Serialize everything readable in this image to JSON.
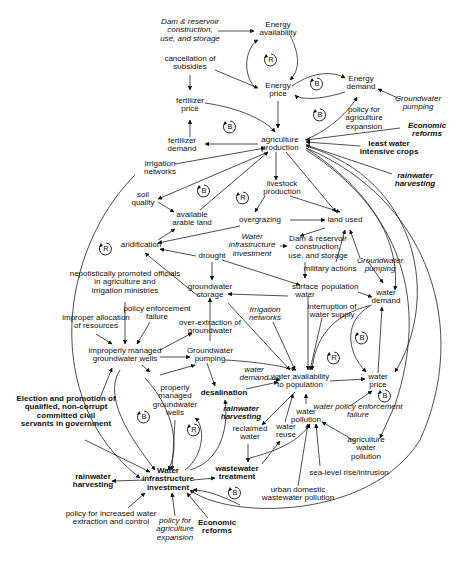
{
  "diagram": {
    "type": "causal-loop-diagram",
    "nodes": [
      {
        "id": "dam_top",
        "label": "Dam & reservoir\nconstruction,\nuse, and storage",
        "style": "italic",
        "x": 190,
        "y": 31
      },
      {
        "id": "energy_avail",
        "label": "Energy\navailability",
        "style": "normal",
        "x": 278,
        "y": 29
      },
      {
        "id": "cancel_subs",
        "label": "cancellation of\nsubsidies",
        "style": "normal",
        "x": 190,
        "y": 63
      },
      {
        "id": "energy_price",
        "label": "Energy\nprice",
        "style": "normal",
        "x": 278,
        "y": 90
      },
      {
        "id": "energy_demand",
        "label": "Energy\ndemand",
        "style": "normal",
        "x": 361,
        "y": 83
      },
      {
        "id": "gw_pumping_top",
        "label": "Groundwater\npumping",
        "style": "italic",
        "x": 418,
        "y": 103
      },
      {
        "id": "fert_price",
        "label": "fertilizer\nprice",
        "style": "normal",
        "x": 190,
        "y": 105
      },
      {
        "id": "policy_ag_exp_top",
        "label": "policy for\nagriculture\nexpansion",
        "style": "normal",
        "x": 364,
        "y": 119
      },
      {
        "id": "econ_reforms_top",
        "label": "Economic\nreforms",
        "style": "bold-italic",
        "x": 427,
        "y": 130
      },
      {
        "id": "fert_demand",
        "label": "fertilizer\ndemand",
        "style": "normal",
        "x": 182,
        "y": 145
      },
      {
        "id": "ag_production",
        "label": "agriculture\nproduction",
        "style": "normal",
        "x": 280,
        "y": 144
      },
      {
        "id": "least_water",
        "label": "least water\nintensive crops",
        "style": "bold",
        "x": 389,
        "y": 148
      },
      {
        "id": "irr_networks_top",
        "label": "irrigation\nnetworks",
        "style": "normal",
        "x": 160,
        "y": 168
      },
      {
        "id": "rain_harv_top",
        "label": "rainwater\nharvesting",
        "style": "bold-italic",
        "x": 415,
        "y": 180
      },
      {
        "id": "livestock",
        "label": "livestock\nproduction",
        "style": "normal",
        "x": 282,
        "y": 188
      },
      {
        "id": "soil_quality",
        "label": "soil\nquality",
        "style": "normal",
        "x": 143,
        "y": 199
      },
      {
        "id": "arable_land",
        "label": "available\narable land",
        "style": "normal",
        "x": 192,
        "y": 219
      },
      {
        "id": "overgrazing",
        "label": "overgrazing",
        "style": "normal",
        "x": 260,
        "y": 220
      },
      {
        "id": "land_used",
        "label": "land used",
        "style": "normal",
        "x": 345,
        "y": 220
      },
      {
        "id": "aridification",
        "label": "aridification",
        "style": "normal",
        "x": 141,
        "y": 245
      },
      {
        "id": "water_infra_mid",
        "label": "Water\ninfrastructure\ninvestment",
        "style": "italic",
        "x": 267,
        "y": 246
      },
      {
        "id": "dam_mid",
        "label": "Dam & reservoir\nconstruction,\nuse, and storage",
        "style": "normal",
        "x": 302,
        "y": 248
      },
      {
        "id": "drought",
        "label": "drought",
        "style": "normal",
        "x": 212,
        "y": 256
      },
      {
        "id": "military",
        "label": "military actions",
        "style": "normal",
        "x": 342,
        "y": 269
      },
      {
        "id": "gw_pumping_mid",
        "label": "Groundwater\npumping",
        "style": "italic",
        "x": 363,
        "y": 267
      },
      {
        "id": "nepotism",
        "label": "nepotistically promoted officials\nin agriculture and\nirrigation ministries",
        "style": "normal",
        "x": 125,
        "y": 283
      },
      {
        "id": "gw_storage",
        "label": "groundwater\nstorage",
        "style": "normal",
        "x": 210,
        "y": 291
      },
      {
        "id": "surface_water",
        "label": "surface\nwater",
        "style": "normal",
        "x": 305,
        "y": 291
      },
      {
        "id": "population",
        "label": "population",
        "style": "normal",
        "x": 346,
        "y": 287
      },
      {
        "id": "water_demand_r",
        "label": "water\ndemand",
        "style": "normal",
        "x": 386,
        "y": 297
      },
      {
        "id": "policy_enf_left",
        "label": "policy enforcement\nfailure",
        "style": "normal",
        "x": 157,
        "y": 313
      },
      {
        "id": "improper_alloc",
        "label": "improper allocation\nof resources",
        "style": "normal",
        "x": 96,
        "y": 322
      },
      {
        "id": "overextraction",
        "label": "over-extraction of\ngroundwater",
        "style": "normal",
        "x": 210,
        "y": 327
      },
      {
        "id": "irr_networks_mid",
        "label": "Irrigation\nnetworks",
        "style": "italic",
        "x": 265,
        "y": 314
      },
      {
        "id": "interruption",
        "label": "interruption of\nwater supply",
        "style": "normal",
        "x": 332,
        "y": 311
      },
      {
        "id": "improper_wells",
        "label": "improperly managed\ngroundwater wells",
        "style": "normal",
        "x": 125,
        "y": 355
      },
      {
        "id": "gw_pumping_low",
        "label": "Groundwater\npumping",
        "style": "normal",
        "x": 210,
        "y": 355
      },
      {
        "id": "water_demand_l",
        "label": "water\ndemand",
        "style": "italic",
        "x": 254,
        "y": 374
      },
      {
        "id": "water_avail",
        "label": "water availability\nto population",
        "style": "normal",
        "x": 300,
        "y": 381
      },
      {
        "id": "water_price",
        "label": "water\nprice",
        "style": "normal",
        "x": 378,
        "y": 381
      },
      {
        "id": "election",
        "label": "Election and promotion of\nqualified, non-corrupt\ncommitted civil\nservants in government",
        "style": "bold",
        "x": 66,
        "y": 412
      },
      {
        "id": "properly_wells",
        "label": "properly\nmanaged\ngroundwater\nwells",
        "style": "normal",
        "x": 175,
        "y": 401
      },
      {
        "id": "desalination",
        "label": "desalination",
        "style": "bold",
        "x": 224,
        "y": 393
      },
      {
        "id": "rain_harv_mid",
        "label": "rainwater\nharvesting",
        "style": "bold-italic",
        "x": 241,
        "y": 413
      },
      {
        "id": "water_policy",
        "label": "water policy enforcement\nfailure",
        "style": "italic-mixed",
        "x": 349,
        "y": 413
      },
      {
        "id": "pollution",
        "label": "water\npollution",
        "style": "normal",
        "x": 306,
        "y": 413
      },
      {
        "id": "reclaimed",
        "label": "reclaimed\nwater",
        "style": "normal",
        "x": 250,
        "y": 433
      },
      {
        "id": "water_reuse",
        "label": "water\nreuse",
        "style": "normal",
        "x": 286,
        "y": 431
      },
      {
        "id": "ag_water_poll",
        "label": "agriculture\nwater\npollution",
        "style": "normal",
        "x": 366,
        "y": 449
      },
      {
        "id": "sea_level",
        "label": "sea-level rise/intrusion",
        "style": "normal",
        "x": 349,
        "y": 473
      },
      {
        "id": "wastewater",
        "label": "wastewater\ntreatment",
        "style": "bold",
        "x": 237,
        "y": 473
      },
      {
        "id": "urban_poll",
        "label": "urban domestic\nwastewater pollution",
        "style": "normal",
        "x": 298,
        "y": 494
      },
      {
        "id": "water_infra_main",
        "label": "Water\ninfrastructure\ninvestment",
        "style": "bold",
        "x": 168,
        "y": 480
      },
      {
        "id": "rain_harv_bottom",
        "label": "rainwater\nharvesting",
        "style": "bold",
        "x": 93,
        "y": 481
      },
      {
        "id": "policy_incr",
        "label": "policy for increased water\nextraction and control",
        "style": "normal",
        "x": 111,
        "y": 518
      },
      {
        "id": "policy_ag_exp_bottom",
        "label": "policy for\nagriculture\nexpansion",
        "style": "italic",
        "x": 175,
        "y": 530
      },
      {
        "id": "econ_reforms_bottom",
        "label": "Economic\nreforms",
        "style": "bold",
        "x": 217,
        "y": 527
      }
    ],
    "loops": [
      {
        "type": "R",
        "x": 271,
        "y": 60
      },
      {
        "type": "B",
        "x": 317,
        "y": 84
      },
      {
        "type": "B",
        "x": 230,
        "y": 127
      },
      {
        "type": "B",
        "x": 320,
        "y": 115
      },
      {
        "type": "R",
        "x": 243,
        "y": 198
      },
      {
        "type": "B",
        "x": 204,
        "y": 191
      },
      {
        "type": "R",
        "x": 106,
        "y": 249
      },
      {
        "type": "B",
        "x": 362,
        "y": 338
      },
      {
        "type": "R",
        "x": 334,
        "y": 358
      },
      {
        "type": "B",
        "x": 385,
        "y": 396
      },
      {
        "type": "B",
        "x": 144,
        "y": 417
      },
      {
        "type": "R",
        "x": 194,
        "y": 430
      },
      {
        "type": "B",
        "x": 235,
        "y": 493
      }
    ]
  }
}
